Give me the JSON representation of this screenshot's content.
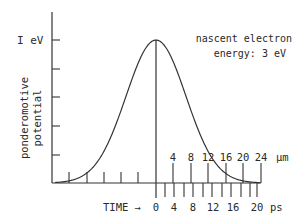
{
  "chart_data": {
    "type": "line",
    "title": "",
    "annotation": [
      "nascent electron",
      "energy: 3 eV"
    ],
    "ylabel": [
      "ponderomotive",
      "potential"
    ],
    "y_tick_label": "I eV",
    "y_ticks_eV": [
      0.2,
      0.4,
      0.6,
      0.8,
      1.0
    ],
    "ylim": [
      0,
      1.0
    ],
    "x_axes": [
      {
        "name": "distance",
        "unit": "µm",
        "tick_labels": [
          "4",
          "8",
          "12",
          "16",
          "20",
          "24"
        ],
        "ticks": [
          4,
          8,
          12,
          16,
          20,
          24
        ],
        "unlabeled_negative_ticks": [
          -4,
          -8,
          -12,
          -16,
          -20
        ]
      },
      {
        "name": "time",
        "prefix": "TIME →",
        "unit": "ps",
        "tick_labels": [
          "0",
          "4",
          "8",
          "12",
          "16",
          "20"
        ],
        "ticks": [
          0,
          4,
          8,
          12,
          16,
          20
        ],
        "minor_step": 2
      }
    ],
    "series": [
      {
        "name": "ponderomotive potential (Gaussian)",
        "x_um": [
          -24,
          -20,
          -16,
          -12,
          -8,
          -4,
          0,
          4,
          8,
          12,
          16,
          20,
          24
        ],
        "values_eV": [
          0.0,
          0.03,
          0.09,
          0.22,
          0.44,
          0.7,
          1.0,
          0.7,
          0.44,
          0.22,
          0.09,
          0.03,
          0.0
        ]
      }
    ],
    "grid": false
  },
  "labels": {
    "y_top": "I eV",
    "ylabel_line1": "ponderomotive",
    "ylabel_line2": "potential",
    "note_line1": "nascent electron",
    "note_line2": "energy: 3 eV",
    "um_unit": "µm",
    "time_prefix": "TIME →",
    "ps_unit": "ps",
    "um_ticks": [
      "4",
      "8",
      "12",
      "16",
      "20",
      "24"
    ],
    "ps_ticks": [
      "0",
      "4",
      "8",
      "12",
      "16",
      "20"
    ]
  }
}
